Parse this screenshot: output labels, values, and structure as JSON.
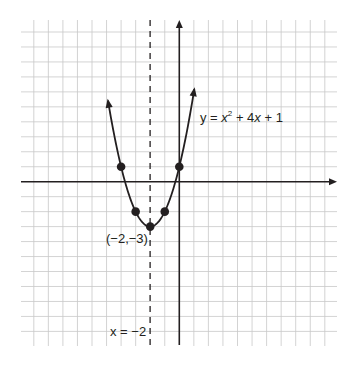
{
  "chart_data": {
    "type": "line",
    "title": "",
    "function": "y = x^2 + 4x + 1",
    "equation_label": {
      "prefix": "y = ",
      "var1": "x",
      "sup": "2",
      "mid": " + 4",
      "var2": "x",
      "suffix": " + 1"
    },
    "vertex": {
      "x": -2,
      "y": -3,
      "label": "(−2,−3)"
    },
    "axis_of_symmetry": {
      "x": -2,
      "label": "x = −2",
      "style": "dashed"
    },
    "points": [
      {
        "x": -4,
        "y": 1
      },
      {
        "x": -3,
        "y": -2
      },
      {
        "x": -2,
        "y": -3
      },
      {
        "x": -1,
        "y": -2
      },
      {
        "x": 0,
        "y": 1
      }
    ],
    "curve_domain": [
      -4.9,
      1.03
    ],
    "xlim": [
      -10,
      10
    ],
    "ylim": [
      -10,
      10
    ],
    "grid": true,
    "xlabel": "",
    "ylabel": "",
    "colors": {
      "grid": "#c8c8c8",
      "axis": "#231f20",
      "curve": "#231f20"
    }
  }
}
